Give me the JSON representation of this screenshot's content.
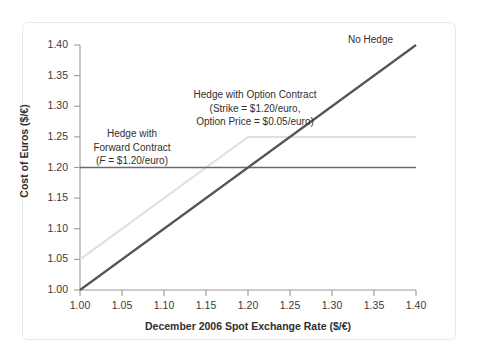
{
  "chart_data": {
    "type": "line",
    "title": "",
    "xlabel": "December 2006 Spot Exchange Rate ($/€)",
    "ylabel": "Cost of Euros ($/€)",
    "xlim": [
      1.0,
      1.4
    ],
    "ylim": [
      1.0,
      1.4
    ],
    "xticks": [
      "1.00",
      "1.05",
      "1.10",
      "1.15",
      "1.20",
      "1.25",
      "1.30",
      "1.35",
      "1.40"
    ],
    "yticks": [
      "1.00",
      "1.05",
      "1.10",
      "1.15",
      "1.20",
      "1.25",
      "1.30",
      "1.35",
      "1.40"
    ],
    "xtick_values": [
      1.0,
      1.05,
      1.1,
      1.15,
      1.2,
      1.25,
      1.3,
      1.35,
      1.4
    ],
    "ytick_values": [
      1.0,
      1.05,
      1.1,
      1.15,
      1.2,
      1.25,
      1.3,
      1.35,
      1.4
    ],
    "grid": false,
    "legend_position": "none",
    "series": [
      {
        "name": "No Hedge",
        "color": "#555555",
        "width": 2.2,
        "x": [
          1.0,
          1.4
        ],
        "values": [
          1.0,
          1.4
        ]
      },
      {
        "name": "Hedge with Forward Contract",
        "color": "#6a6a6a",
        "width": 1.6,
        "x": [
          1.0,
          1.4
        ],
        "values": [
          1.2,
          1.2
        ]
      },
      {
        "name": "Hedge with Option Contract",
        "color": "#e0e0e0",
        "width": 2.0,
        "x": [
          1.0,
          1.2,
          1.4
        ],
        "values": [
          1.05,
          1.25,
          1.25
        ]
      }
    ],
    "annotations": [
      {
        "name": "no-hedge",
        "lines": [
          "No Hedge"
        ],
        "x": 1.33,
        "y": 1.385
      },
      {
        "name": "option-contract",
        "lines": [
          "Hedge with Option Contract",
          "(Strike = $1.20/euro,",
          "Option Price = $0.05/euro)"
        ],
        "x": 1.16,
        "y": 1.305
      },
      {
        "name": "forward-contract",
        "lines": [
          "Hedge with",
          "Forward Contract",
          "(F = $1.20/euro)"
        ],
        "x": 1.06,
        "y": 1.245
      }
    ]
  },
  "annotations": {
    "no_hedge": "No Hedge",
    "option_line1": "Hedge with Option Contract",
    "option_line2": "(Strike = $1.20/euro,",
    "option_line3": "Option Price = $0.05/euro)",
    "forward_line1": "Hedge with",
    "forward_line2": "Forward Contract",
    "forward_line3_pre": "(",
    "forward_line3_var": "F",
    "forward_line3_post": " = $1.20/euro)"
  },
  "axes": {
    "x_title": "December 2006 Spot Exchange Rate ($/€)",
    "y_title": "Cost of Euros ($/€)",
    "x_labels": [
      "1.00",
      "1.05",
      "1.10",
      "1.15",
      "1.20",
      "1.25",
      "1.30",
      "1.35",
      "1.40"
    ],
    "y_labels": [
      "1.00",
      "1.05",
      "1.10",
      "1.15",
      "1.20",
      "1.25",
      "1.30",
      "1.35",
      "1.40"
    ]
  },
  "margin": {
    "edge_mark": ""
  },
  "colors": {
    "no_hedge": "#555555",
    "forward": "#6a6a6a",
    "option": "#e0e0e0",
    "axis": "#9a9a9a",
    "text": "#2f2f2f",
    "frame": "#e9e9e9"
  }
}
